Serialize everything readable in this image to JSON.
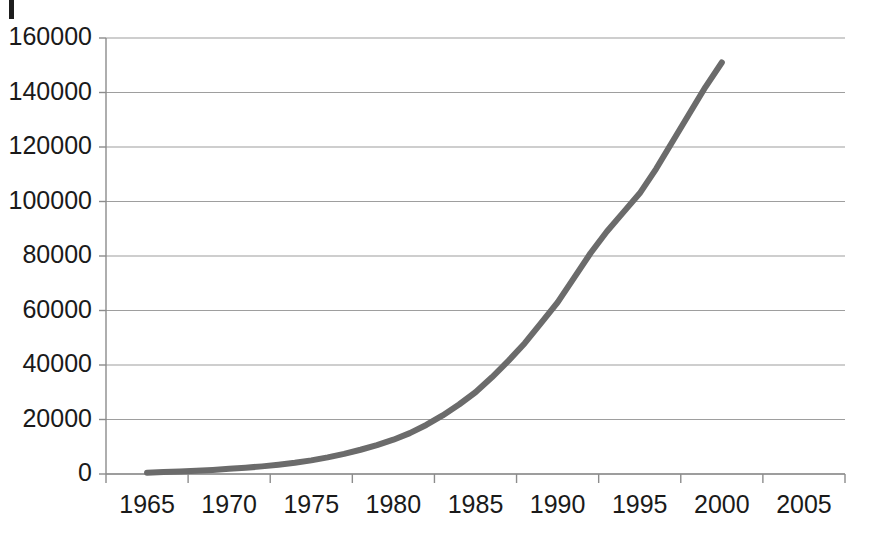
{
  "chart_data": {
    "type": "line",
    "title": "",
    "subtitle": "",
    "xlabel": "",
    "ylabel": "",
    "legend": [],
    "legend_position": "none",
    "grid": "horizontal",
    "xlim": [
      1962.5,
      2007.5
    ],
    "ylim": [
      0,
      160000
    ],
    "xtick_labels": [
      "1965",
      "1970",
      "1975",
      "1980",
      "1985",
      "1990",
      "1995",
      "2000",
      "2005"
    ],
    "xticks": [
      1965,
      1970,
      1975,
      1980,
      1985,
      1990,
      1995,
      2000,
      2005
    ],
    "ytick_labels": [
      "0",
      "20000",
      "40000",
      "60000",
      "80000",
      "100000",
      "120000",
      "140000",
      "160000"
    ],
    "yticks": [
      0,
      20000,
      40000,
      60000,
      80000,
      100000,
      120000,
      140000,
      160000
    ],
    "series": [
      {
        "name": "series-1",
        "color": "#6b6b6b",
        "line_width": 6,
        "x": [
          1965,
          1966,
          1967,
          1968,
          1969,
          1970,
          1971,
          1972,
          1973,
          1974,
          1975,
          1976,
          1977,
          1978,
          1979,
          1980,
          1981,
          1982,
          1983,
          1984,
          1985,
          1986,
          1987,
          1988,
          1989,
          1990,
          1991,
          1992,
          1993,
          1994,
          1995,
          1996,
          1997,
          1998,
          1999,
          2000
        ],
        "values": [
          500,
          700,
          900,
          1200,
          1500,
          1900,
          2300,
          2800,
          3400,
          4100,
          5000,
          6100,
          7400,
          8900,
          10600,
          12600,
          15000,
          18000,
          21500,
          25500,
          30000,
          35500,
          41500,
          48000,
          55500,
          63000,
          72000,
          81000,
          89000,
          96000,
          103000,
          112000,
          122000,
          132000,
          142000,
          151000
        ]
      }
    ],
    "axis_color": "#8c8c8c",
    "grid_color": "#9e9e9e",
    "background": "#ffffff"
  },
  "artifacts": {
    "edge_mark_name": "page-edge-mark"
  }
}
